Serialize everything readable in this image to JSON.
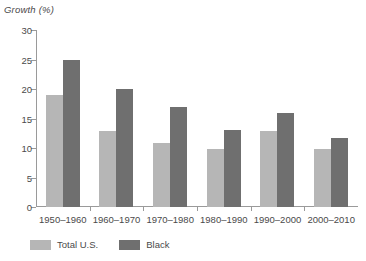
{
  "chart_data": {
    "type": "bar",
    "title": "",
    "ylabel": "Growth (%)",
    "xlabel": "",
    "ylim": [
      0,
      30
    ],
    "yticks": [
      0,
      5,
      10,
      15,
      20,
      25,
      30
    ],
    "grid": false,
    "legend_position": "bottom-left",
    "categories": [
      "1950–1960",
      "1960–1970",
      "1970–1980",
      "1980–1990",
      "1990–2000",
      "2000–2010"
    ],
    "series": [
      {
        "name": "Total U.S.",
        "color": "#b6b6b6",
        "values": [
          19,
          12.9,
          10.8,
          9.9,
          12.8,
          9.8
        ]
      },
      {
        "name": "Black",
        "color": "#6f6f6f",
        "values": [
          25,
          20,
          17,
          13,
          16,
          11.7
        ]
      }
    ]
  },
  "legend": {
    "items": [
      {
        "label": "Total U.S.",
        "color": "#b6b6b6"
      },
      {
        "label": "Black",
        "color": "#6f6f6f"
      }
    ]
  },
  "colors": {
    "total_us": "#b6b6b6",
    "black": "#6f6f6f",
    "axis": "#9a9a9a",
    "text": "#4a4a4a",
    "background": "#ffffff"
  }
}
